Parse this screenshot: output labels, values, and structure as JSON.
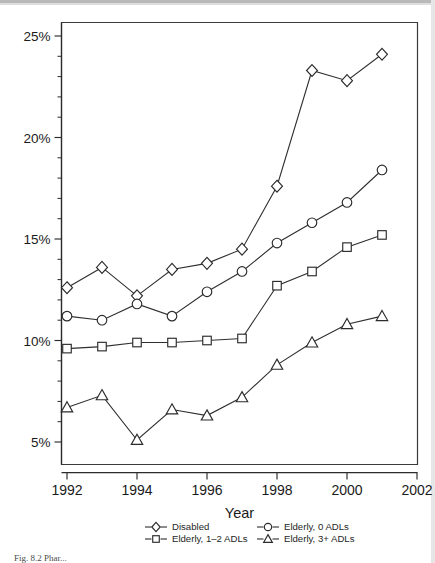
{
  "figure": {
    "caption": "Fig. 8.2   Phar...",
    "background_color": "#ffffff",
    "ink_color": "#2b2b2b"
  },
  "chart_data": {
    "type": "line",
    "title": "",
    "xlabel": "Year",
    "ylabel": "",
    "xlim": [
      1991.5,
      2002.0
    ],
    "ylim": [
      4.3,
      25.7
    ],
    "xticks": [
      1992,
      1994,
      1996,
      1998,
      2000,
      2002
    ],
    "xtick_labels": [
      "1992",
      "1994",
      "1996",
      "1998",
      "2000",
      "2002"
    ],
    "yticks": [
      5,
      10,
      15,
      20,
      25
    ],
    "ytick_labels": [
      "5%",
      "10%",
      "15%",
      "20%",
      "25%"
    ],
    "y_minor_tick_step": 1,
    "grid": false,
    "legend_position": "below-axis",
    "x": [
      1992,
      1993,
      1994,
      1995,
      1996,
      1997,
      1998,
      1999,
      2000,
      2001
    ],
    "series": [
      {
        "name": "Disabled",
        "marker": "diamond",
        "values": [
          12.6,
          13.6,
          12.2,
          13.5,
          13.8,
          14.5,
          17.6,
          23.3,
          22.8,
          24.1
        ]
      },
      {
        "name": "Elderly, 0 ADLs",
        "marker": "circle",
        "values": [
          11.2,
          11.0,
          11.8,
          11.2,
          12.4,
          13.4,
          14.8,
          15.8,
          16.8,
          18.4
        ]
      },
      {
        "name": "Elderly, 1–2 ADLs",
        "marker": "square",
        "values": [
          9.6,
          9.7,
          9.9,
          9.9,
          10.0,
          10.1,
          12.7,
          13.4,
          14.6,
          15.2
        ]
      },
      {
        "name": "Elderly, 3+ ADLs",
        "marker": "triangle",
        "values": [
          6.7,
          7.3,
          5.1,
          6.6,
          6.3,
          7.2,
          8.8,
          9.9,
          10.8,
          11.2
        ]
      }
    ]
  },
  "legend": {
    "entries": [
      {
        "label": "Disabled",
        "marker": "diamond"
      },
      {
        "label": "Elderly, 0 ADLs",
        "marker": "circle"
      },
      {
        "label": "Elderly, 1–2 ADLs",
        "marker": "square"
      },
      {
        "label": "Elderly, 3+ ADLs",
        "marker": "triangle"
      }
    ]
  }
}
